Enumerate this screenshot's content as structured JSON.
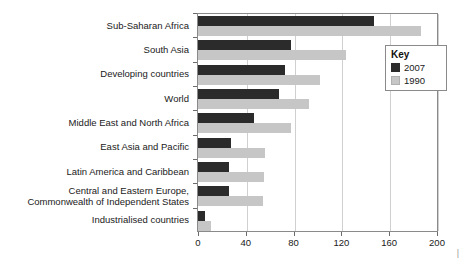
{
  "chart_data": {
    "type": "bar",
    "orientation": "horizontal",
    "title": "",
    "xlabel": "",
    "ylabel": "",
    "xlim": [
      0,
      200
    ],
    "xticks": [
      0,
      40,
      80,
      120,
      160,
      200
    ],
    "grid": true,
    "legend_position": "upper-right",
    "categories": [
      "Sub-Saharan Africa",
      "South Asia",
      "Developing countries",
      "World",
      "Middle East and North Africa",
      "East Asia and Pacific",
      "Latin America and Caribbean",
      "Central and Eastern Europe,\nCommonwealth of Independent States",
      "Industrialised countries"
    ],
    "series": [
      {
        "name": "2007",
        "color": "#2b2b2b",
        "values": [
          147,
          78,
          73,
          68,
          47,
          28,
          26,
          26,
          6
        ]
      },
      {
        "name": "1990",
        "color": "#c6c6c6",
        "values": [
          187,
          124,
          102,
          93,
          78,
          56,
          55,
          54,
          11
        ]
      }
    ]
  },
  "legend": {
    "title": "Key",
    "entries": [
      {
        "label": "2007",
        "color": "#2b2b2b"
      },
      {
        "label": "1990",
        "color": "#c6c6c6"
      }
    ]
  },
  "axis": {
    "tick_labels": [
      "0",
      "40",
      "80",
      "120",
      "160",
      "200"
    ]
  },
  "edge_mark": "|"
}
